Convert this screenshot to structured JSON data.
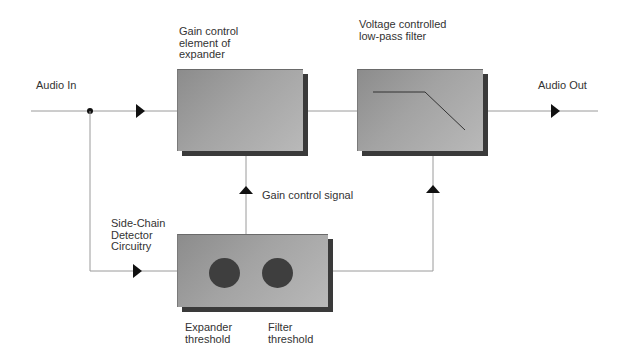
{
  "diagram": {
    "labels": {
      "audio_in": "Audio In",
      "audio_out": "Audio Out",
      "gain_element": "Gain control\nelement of\nexpander",
      "vcf": "Voltage controlled\nlow-pass filter",
      "gain_signal": "Gain control signal",
      "side_chain": "Side-Chain\nDetector\nCircuitry",
      "expander_threshold": "Expander\nthreshold",
      "filter_threshold": "Filter\nthreshold"
    },
    "nodes": [
      {
        "id": "gain_element",
        "label": "Gain control element of expander"
      },
      {
        "id": "vcf",
        "label": "Voltage controlled low-pass filter"
      },
      {
        "id": "side_chain",
        "label": "Side-Chain Detector Circuitry",
        "controls": [
          "Expander threshold",
          "Filter threshold"
        ]
      }
    ],
    "edges": [
      {
        "from": "Audio In",
        "to": "gain_element"
      },
      {
        "from": "Audio In",
        "to": "side_chain"
      },
      {
        "from": "gain_element",
        "to": "vcf"
      },
      {
        "from": "vcf",
        "to": "Audio Out"
      },
      {
        "from": "side_chain",
        "to": "gain_element",
        "label": "Gain control signal"
      },
      {
        "from": "side_chain",
        "to": "vcf"
      }
    ],
    "colors": {
      "line": "#9a9a9a",
      "arrow": "#111111",
      "box_dark": "#8c8c8c",
      "box_light": "#b9b9b9",
      "shadow": "#3a3a3a",
      "knob": "#3e3e3e"
    }
  }
}
